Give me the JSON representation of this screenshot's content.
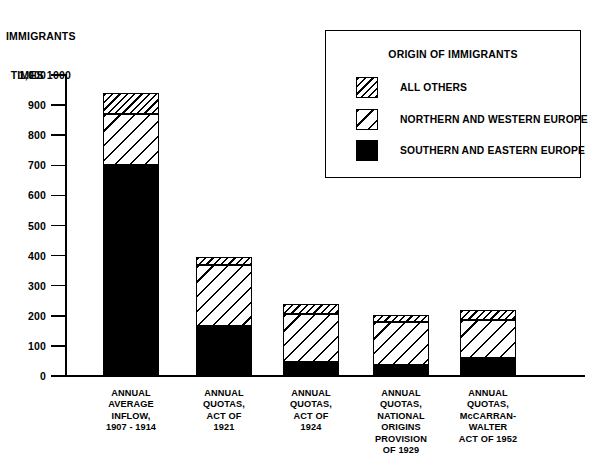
{
  "chart_data": {
    "type": "bar",
    "subtype": "stacked",
    "title": "",
    "ylabel": "IMMIGRANTS TIMES 1000",
    "ylabel_line1": "IMMIGRANTS",
    "ylabel_line2": "TIMES 1000",
    "xlabel": "",
    "ylim": [
      0,
      1000
    ],
    "ytick_step": 100,
    "grid": false,
    "ytick_labels": [
      "1,000",
      "900",
      "800",
      "700",
      "600",
      "500",
      "400",
      "300",
      "200",
      "100",
      "0"
    ],
    "ytick_values": [
      1000,
      900,
      800,
      700,
      600,
      500,
      400,
      300,
      200,
      100,
      0
    ],
    "categories": [
      "ANNUAL AVERAGE INFLOW, 1907 - 1914",
      "ANNUAL QUOTAS, ACT OF 1921",
      "ANNUAL QUOTAS, ACT OF 1924",
      "ANNUAL QUOTAS, NATIONAL ORIGINS PROVISION OF 1929",
      "ANNUAL QUOTAS, McCARRAN-WALTER ACT OF 1952"
    ],
    "category_label_lines": [
      [
        "ANNUAL",
        "AVERAGE",
        "INFLOW,",
        "1907 - 1914"
      ],
      [
        "ANNUAL",
        "QUOTAS,",
        "ACT OF",
        "1921"
      ],
      [
        "ANNUAL",
        "QUOTAS,",
        "ACT OF",
        "1924"
      ],
      [
        "ANNUAL",
        "QUOTAS,",
        "NATIONAL",
        "ORIGINS",
        "PROVISION",
        "OF 1929"
      ],
      [
        "ANNUAL",
        "QUOTAS,",
        "McCARRAN-",
        "WALTER",
        "ACT OF 1952"
      ]
    ],
    "series": [
      {
        "name": "SOUTHERN AND EASTERN EUROPE",
        "pattern": "solid-black",
        "values": [
          700,
          165,
          45,
          38,
          60
        ]
      },
      {
        "name": "NORTHERN AND WESTERN EUROPE",
        "pattern": "sparse-diagonal-hatch",
        "values": [
          170,
          205,
          161,
          142,
          127
        ]
      },
      {
        "name": "ALL OTHERS",
        "pattern": "dense-diagonal-hatch",
        "values": [
          70,
          25,
          32,
          22,
          31
        ]
      }
    ],
    "totals": [
      940,
      395,
      238,
      202,
      218
    ],
    "legend_position": "top-right"
  },
  "legend": {
    "title": "ORIGIN OF IMMIGRANTS",
    "entries": [
      {
        "label": "ALL OTHERS",
        "pattern": "dense-diagonal-hatch"
      },
      {
        "label": "NORTHERN AND WESTERN EUROPE",
        "pattern": "sparse-diagonal-hatch"
      },
      {
        "label": "SOUTHERN AND EASTERN EUROPE",
        "pattern": "solid-black"
      }
    ]
  },
  "colors": {
    "ink": "#000000",
    "paper": "#ffffff"
  }
}
